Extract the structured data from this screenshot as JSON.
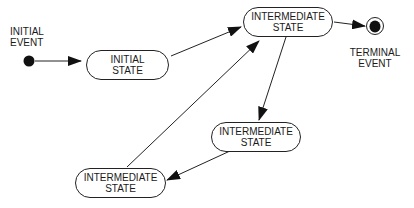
{
  "diagram": {
    "type": "state-machine",
    "initial_event": {
      "line1": "INITIAL",
      "line2": "EVENT"
    },
    "terminal_event": {
      "line1": "TERMINAL",
      "line2": "EVENT"
    },
    "states": [
      {
        "id": "initial",
        "line1": "INITIAL",
        "line2": "STATE"
      },
      {
        "id": "intermediate-top",
        "line1": "INTERMEDIATE",
        "line2": "STATE"
      },
      {
        "id": "intermediate-mid",
        "line1": "INTERMEDIATE",
        "line2": "STATE"
      },
      {
        "id": "intermediate-bottom",
        "line1": "INTERMEDIATE",
        "line2": "STATE"
      }
    ],
    "transitions": [
      {
        "from": "initial-event",
        "to": "initial"
      },
      {
        "from": "initial",
        "to": "intermediate-top"
      },
      {
        "from": "intermediate-top",
        "to": "terminal-event"
      },
      {
        "from": "intermediate-top",
        "to": "intermediate-mid"
      },
      {
        "from": "intermediate-mid",
        "to": "intermediate-bottom"
      },
      {
        "from": "intermediate-bottom",
        "to": "intermediate-top"
      }
    ]
  }
}
